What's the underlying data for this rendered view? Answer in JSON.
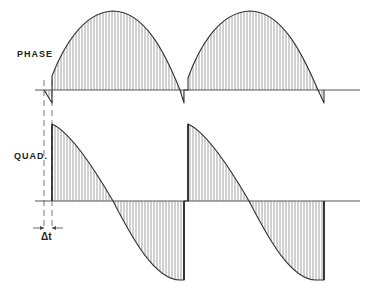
{
  "labels": {
    "phase": "PHASE",
    "quad": "QUAD.",
    "delta_t": "Δt"
  },
  "colors": {
    "line": "#333333",
    "hatch": "#888888",
    "background": "#ffffff"
  },
  "phase_trace": {
    "baseline_y": 90,
    "x_start": 35,
    "x_end": 360,
    "segments": [
      {
        "x0": 52,
        "x1": 184,
        "y_start": 76,
        "peak_y": 11,
        "end_y": 103
      },
      {
        "x0": 188,
        "x1": 324,
        "y_start": 78,
        "peak_y": 11,
        "end_y": 103
      }
    ]
  },
  "quad_trace": {
    "baseline_y": 201,
    "x_start": 35,
    "x_end": 360,
    "segments": [
      {
        "x0": 52,
        "x1": 184,
        "top_y": 124,
        "min_y": 280
      },
      {
        "x0": 188,
        "x1": 324,
        "top_y": 124,
        "min_y": 280
      }
    ]
  },
  "markers": {
    "dashed_left_x": 44,
    "dashed_right_x": 52
  }
}
